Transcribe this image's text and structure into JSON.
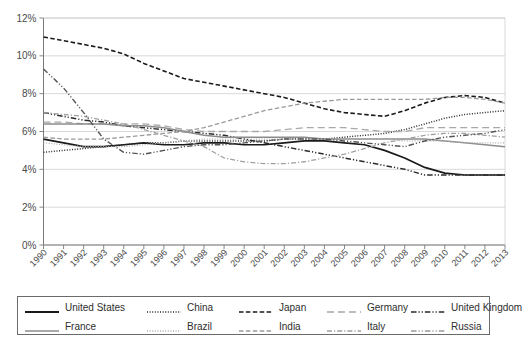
{
  "chart_data": {
    "type": "line",
    "title": "",
    "xlabel": "",
    "ylabel": "",
    "ylim": [
      0,
      12
    ],
    "yticks": [
      "0%",
      "2%",
      "4%",
      "6%",
      "8%",
      "10%",
      "12%"
    ],
    "ytick_values": [
      0,
      2,
      4,
      6,
      8,
      10,
      12
    ],
    "grid": true,
    "legend_position": "bottom",
    "x": [
      1990,
      1991,
      1992,
      1993,
      1994,
      1995,
      1996,
      1997,
      1998,
      1999,
      2000,
      2001,
      2002,
      2003,
      2004,
      2005,
      2006,
      2007,
      2008,
      2009,
      2010,
      2011,
      2012,
      2013
    ],
    "xtick_labels": [
      "1990",
      "1991",
      "1992",
      "1993",
      "1994",
      "1995",
      "1996",
      "1997",
      "1998",
      "1999",
      "2000",
      "2001",
      "2002",
      "2003",
      "2004",
      "2005",
      "2006",
      "2007",
      "2008",
      "2009",
      "2010",
      "2011",
      "2012",
      "2013"
    ],
    "series": [
      {
        "name": "United States",
        "color": "#1a1a1a",
        "style": "solid",
        "width": 1.7,
        "values": [
          5.6,
          5.4,
          5.2,
          5.2,
          5.3,
          5.4,
          5.3,
          5.3,
          5.4,
          5.4,
          5.3,
          5.3,
          5.4,
          5.5,
          5.5,
          5.4,
          5.3,
          5.0,
          4.6,
          4.1,
          3.8,
          3.7,
          3.7,
          3.7
        ]
      },
      {
        "name": "China",
        "color": "#2b2b2b",
        "style": "dotted",
        "width": 1.5,
        "values": [
          4.9,
          5.0,
          5.1,
          5.2,
          5.3,
          5.4,
          5.4,
          5.5,
          5.5,
          5.5,
          5.5,
          5.5,
          5.6,
          5.6,
          5.6,
          5.7,
          5.8,
          5.9,
          6.1,
          6.4,
          6.7,
          6.9,
          7.0,
          7.1
        ]
      },
      {
        "name": "Japan",
        "color": "#1a1a1a",
        "style": "dashed",
        "width": 1.6,
        "values": [
          11.0,
          10.8,
          10.6,
          10.4,
          10.1,
          9.6,
          9.2,
          8.8,
          8.6,
          8.4,
          8.2,
          8.0,
          7.8,
          7.5,
          7.2,
          7.0,
          6.9,
          6.8,
          7.1,
          7.5,
          7.8,
          7.9,
          7.8,
          7.5
        ]
      },
      {
        "name": "Germany",
        "color": "#a8a8a8",
        "style": "longdash",
        "width": 1.3,
        "values": [
          6.5,
          6.5,
          6.4,
          6.4,
          6.4,
          6.4,
          6.3,
          6.1,
          6.0,
          6.0,
          6.0,
          6.0,
          6.1,
          6.2,
          6.2,
          6.2,
          6.1,
          6.0,
          6.0,
          6.2,
          6.2,
          6.2,
          6.2,
          6.2
        ]
      },
      {
        "name": "United Kingdom",
        "color": "#2b2b2b",
        "style": "dashdotdot",
        "width": 1.5,
        "values": [
          7.0,
          6.8,
          6.6,
          6.5,
          6.3,
          6.2,
          6.1,
          6.0,
          5.9,
          5.8,
          5.6,
          5.4,
          5.2,
          5.0,
          4.8,
          4.6,
          4.4,
          4.2,
          4.0,
          3.7,
          3.7,
          3.7,
          3.7,
          3.7
        ]
      },
      {
        "name": "France",
        "color": "#8c8c8c",
        "style": "solid",
        "width": 1.5,
        "values": [
          6.4,
          6.4,
          6.4,
          6.4,
          6.3,
          6.3,
          6.2,
          6.0,
          5.8,
          5.7,
          5.7,
          5.7,
          5.7,
          5.7,
          5.6,
          5.6,
          5.6,
          5.6,
          5.6,
          5.6,
          5.5,
          5.4,
          5.3,
          5.2
        ]
      },
      {
        "name": "Brazil",
        "color": "#b0b0b0",
        "style": "dotted",
        "width": 1.3,
        "values": [
          5.4,
          5.3,
          5.2,
          5.2,
          5.2,
          5.3,
          5.4,
          5.5,
          5.6,
          5.6,
          5.6,
          5.6,
          5.6,
          5.6,
          5.6,
          5.6,
          5.6,
          5.6,
          5.5,
          5.5,
          5.5,
          5.4,
          5.4,
          5.4
        ]
      },
      {
        "name": "India",
        "color": "#9a9a9a",
        "style": "dashed",
        "width": 1.3,
        "values": [
          5.7,
          5.6,
          5.6,
          5.6,
          5.7,
          5.8,
          5.9,
          6.0,
          6.2,
          6.5,
          6.8,
          7.1,
          7.3,
          7.5,
          7.6,
          7.7,
          7.7,
          7.7,
          7.7,
          7.7,
          7.8,
          7.8,
          7.7,
          7.5
        ]
      },
      {
        "name": "Italy",
        "color": "#a0a0a0",
        "style": "dashdot",
        "width": 1.3,
        "values": [
          7.0,
          6.9,
          6.8,
          6.6,
          6.4,
          6.1,
          5.8,
          5.5,
          5.2,
          4.6,
          4.4,
          4.3,
          4.3,
          4.4,
          4.6,
          4.8,
          5.1,
          5.4,
          5.6,
          5.8,
          5.9,
          5.9,
          5.8,
          5.7
        ]
      },
      {
        "name": "Russia",
        "color": "#555555",
        "style": "dashdotdot",
        "width": 1.4,
        "values": [
          9.3,
          8.3,
          7.0,
          5.6,
          4.9,
          4.8,
          5.0,
          5.2,
          5.3,
          5.3,
          5.4,
          5.5,
          5.6,
          5.6,
          5.6,
          5.5,
          5.4,
          5.3,
          5.2,
          5.5,
          5.7,
          5.8,
          5.9,
          6.1
        ]
      }
    ]
  },
  "legend": {
    "items": [
      {
        "label": "United States",
        "sample": "solid",
        "color": "#1a1a1a",
        "width": 2
      },
      {
        "label": "China",
        "sample": "dotted",
        "color": "#2b2b2b",
        "width": 1.6
      },
      {
        "label": "Japan",
        "sample": "dashed",
        "color": "#1a1a1a",
        "width": 1.7
      },
      {
        "label": "Germany",
        "sample": "longdash",
        "color": "#a8a8a8",
        "width": 1.4
      },
      {
        "label": "United Kingdom",
        "sample": "dashdotdot",
        "color": "#2b2b2b",
        "width": 1.6
      },
      {
        "label": "France",
        "sample": "solid",
        "color": "#8c8c8c",
        "width": 1.7
      },
      {
        "label": "Brazil",
        "sample": "dotted",
        "color": "#b0b0b0",
        "width": 1.5
      },
      {
        "label": "India",
        "sample": "dashed",
        "color": "#9a9a9a",
        "width": 1.5
      },
      {
        "label": "Italy",
        "sample": "dashdot",
        "color": "#a0a0a0",
        "width": 1.5
      },
      {
        "label": "Russia",
        "sample": "dashdotdot",
        "color": "#9a9a9a",
        "width": 1.5
      }
    ]
  }
}
